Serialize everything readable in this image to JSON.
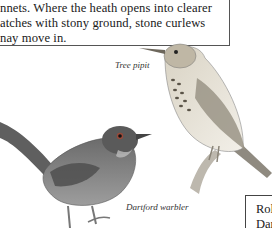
{
  "text_block": {
    "lines": [
      "nnets. Where the heath opens into clearer",
      "atches with stony ground, stone curlews",
      "nay move in."
    ]
  },
  "illustrations": [
    {
      "name": "tree-pipit",
      "caption": "Tree pipit"
    },
    {
      "name": "dartford-warbler",
      "caption": "Dartford warbler"
    }
  ],
  "side_box": {
    "lines": [
      "Rol",
      "Dar",
      "&"
    ]
  }
}
